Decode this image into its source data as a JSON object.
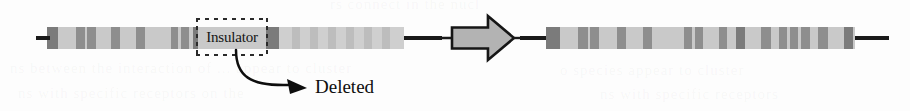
{
  "figure": {
    "type": "chromosome-deletion-diagram",
    "insulator_label": "Insulator",
    "deleted_label": "Deleted",
    "colors": {
      "chromosome_background": "#c9c9c9",
      "band": "#8e8e8e",
      "band_dark": "#7b7b7b",
      "band_pale": "#bdbdbd",
      "telomere": "#1a1a1a",
      "arrow_fill": "#b3b3b3",
      "arrow_outline": "#161616",
      "text": "#0e0e0e",
      "page_background": "#fdfdfd"
    }
  },
  "chart_data": {
    "type": "diagram",
    "annotations": [
      "Insulator",
      "Deleted"
    ],
    "panels": [
      {
        "name": "before-chromosome",
        "x": 36,
        "y": 27,
        "width": 406,
        "telomere_left": {
          "x": 36,
          "width": 14
        },
        "telomere_right": {
          "x": 404,
          "width": 38
        },
        "body_segments": [
          {
            "x": 47,
            "width": 219,
            "shade": "normal"
          },
          {
            "x": 266,
            "width": 138,
            "shade": "faded"
          }
        ],
        "bands": [
          {
            "x": 47,
            "width": 11,
            "shade": "dark"
          },
          {
            "x": 76,
            "width": 9,
            "shade": "normal"
          },
          {
            "x": 87,
            "width": 9,
            "shade": "normal"
          },
          {
            "x": 111,
            "width": 9,
            "shade": "normal"
          },
          {
            "x": 136,
            "width": 9,
            "shade": "normal"
          },
          {
            "x": 171,
            "width": 7,
            "shade": "normal"
          },
          {
            "x": 181,
            "width": 8,
            "shade": "normal"
          },
          {
            "x": 193,
            "width": 5,
            "shade": "dark"
          },
          {
            "x": 266,
            "width": 13,
            "shade": "dark"
          },
          {
            "x": 292,
            "width": 8,
            "shade": "pale"
          },
          {
            "x": 310,
            "width": 8,
            "shade": "pale"
          },
          {
            "x": 328,
            "width": 8,
            "shade": "pale"
          },
          {
            "x": 346,
            "width": 8,
            "shade": "pale"
          },
          {
            "x": 364,
            "width": 8,
            "shade": "pale"
          },
          {
            "x": 382,
            "width": 8,
            "shade": "pale"
          }
        ]
      },
      {
        "name": "after-chromosome",
        "x": 520,
        "y": 27,
        "width": 356,
        "telomere_left": {
          "x": 520,
          "width": 26
        },
        "telomere_right": {
          "x": 855,
          "width": 34
        },
        "body_segments": [
          {
            "x": 546,
            "width": 309,
            "shade": "normal"
          }
        ],
        "bands": [
          {
            "x": 546,
            "width": 14,
            "shade": "dark"
          },
          {
            "x": 578,
            "width": 10,
            "shade": "normal"
          },
          {
            "x": 590,
            "width": 9,
            "shade": "normal"
          },
          {
            "x": 617,
            "width": 9,
            "shade": "normal"
          },
          {
            "x": 643,
            "width": 9,
            "shade": "normal"
          },
          {
            "x": 684,
            "width": 8,
            "shade": "normal"
          },
          {
            "x": 695,
            "width": 8,
            "shade": "normal"
          },
          {
            "x": 719,
            "width": 8,
            "shade": "normal"
          },
          {
            "x": 736,
            "width": 9,
            "shade": "dark"
          },
          {
            "x": 761,
            "width": 10,
            "shade": "normal"
          },
          {
            "x": 779,
            "width": 8,
            "shade": "normal"
          },
          {
            "x": 790,
            "width": 8,
            "shade": "normal"
          },
          {
            "x": 801,
            "width": 9,
            "shade": "normal"
          },
          {
            "x": 818,
            "width": 10,
            "shade": "normal"
          },
          {
            "x": 844,
            "width": 9,
            "shade": "dark"
          }
        ]
      }
    ],
    "insulator_bracket": {
      "x": 196,
      "y": 18,
      "width": 72,
      "height": 38
    },
    "transition_arrow": {
      "x": 452,
      "y": 16,
      "width": 62,
      "height": 44,
      "direction": "right"
    },
    "callout_arrow": {
      "from_x": 236,
      "from_y": 50,
      "to_x": 300,
      "to_y": 88
    }
  },
  "ghost_text": {
    "line1": "rs connect in the nucl",
    "line2": "ns between the interaction of ... appear to cluster",
    "line3": "ns with specific receptors on the",
    "line4": "o species appear to cluster",
    "line5": "ns with specific receptors"
  }
}
